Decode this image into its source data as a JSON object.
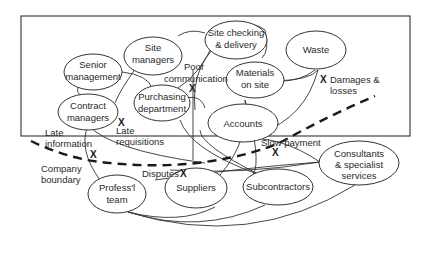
{
  "diagram": {
    "nodes": {
      "senior_management": [
        "Senior",
        "management"
      ],
      "site_managers": [
        "Site",
        "managers"
      ],
      "site_checking": [
        "Site checking",
        "& delivery"
      ],
      "waste": [
        "Waste"
      ],
      "materials_on_site": [
        "Materials",
        "on site"
      ],
      "contract_managers": [
        "Contract",
        "managers"
      ],
      "purchasing_department": [
        "Purchasing",
        "department"
      ],
      "accounts": [
        "Accounts"
      ],
      "consultants": [
        "Consultants",
        "& specialist",
        "services"
      ],
      "professional_team": [
        "Profess'l",
        "team"
      ],
      "suppliers": [
        "Suppliers"
      ],
      "subcontractors": [
        "Subcontractors"
      ]
    },
    "annotations": {
      "poor_communication": [
        "Poor",
        "communication"
      ],
      "damages_losses": [
        "Damages &",
        "losses"
      ],
      "late_requisitions": [
        "Late",
        "requisitions"
      ],
      "late_information": [
        "Late",
        "information"
      ],
      "slow_payment": [
        "Slow payment"
      ],
      "company_boundary": [
        "Company",
        "boundary"
      ],
      "disputes": [
        "Disputes"
      ]
    },
    "x_marker": "X"
  }
}
